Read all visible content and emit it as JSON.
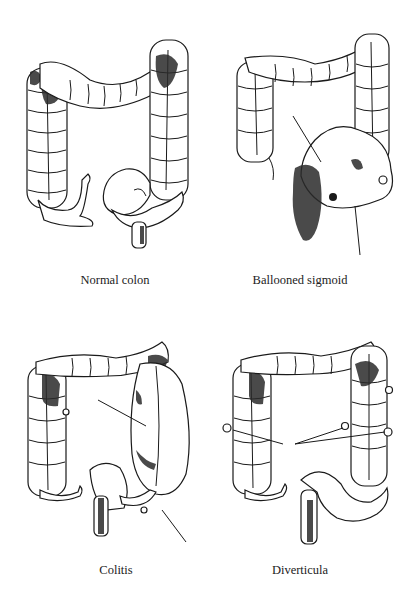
{
  "figure": {
    "panels": [
      {
        "id": "normal",
        "caption": "Normal colon",
        "pointer_count": 0
      },
      {
        "id": "ballooned",
        "caption": "Ballooned sigmoid",
        "pointer_count": 2
      },
      {
        "id": "colitis",
        "caption": "Colitis",
        "pointer_count": 2
      },
      {
        "id": "diverticula",
        "caption": "Diverticula",
        "pointer_count": 2
      }
    ],
    "colors": {
      "ink": "#1a1a1a",
      "background": "#ffffff"
    }
  }
}
